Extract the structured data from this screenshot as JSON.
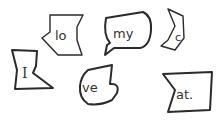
{
  "illustration": {
    "description": "Hand-drawn scattered puzzle pieces each containing a word fragment",
    "pieces": [
      {
        "id": "lo",
        "text": "lo"
      },
      {
        "id": "my",
        "text": "my"
      },
      {
        "id": "c",
        "text": "c"
      },
      {
        "id": "I",
        "text": "I"
      },
      {
        "id": "ve",
        "text": "ve"
      },
      {
        "id": "at",
        "text": "at."
      }
    ],
    "colors": {
      "outline": "#2a2a2a",
      "text": "#333333",
      "background": "#ffffff"
    }
  }
}
